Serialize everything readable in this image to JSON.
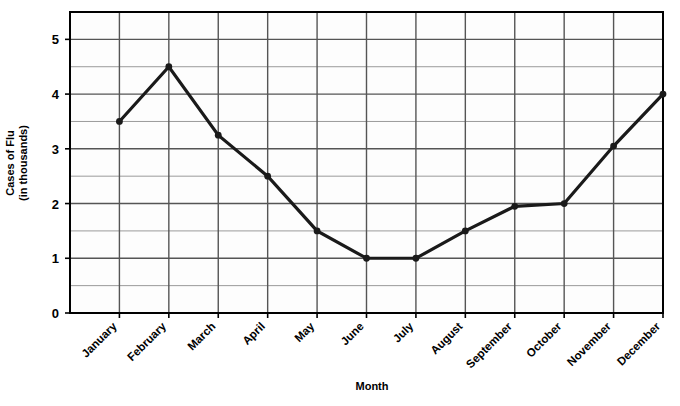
{
  "chart_data": {
    "type": "line",
    "title": "",
    "xlabel": "Month",
    "ylabel": "Cases of Flu (in thousands)",
    "ylabel_lines": [
      "Cases of Flu",
      "(in thousands)"
    ],
    "categories": [
      "January",
      "February",
      "March",
      "April",
      "May",
      "June",
      "July",
      "August",
      "September",
      "October",
      "November",
      "December"
    ],
    "values": [
      3.5,
      4.5,
      3.25,
      2.5,
      1.5,
      1.0,
      1.0,
      1.5,
      1.95,
      2.0,
      3.05,
      4.0
    ],
    "series": [
      {
        "name": "Cases of Flu",
        "values": [
          3.5,
          4.5,
          3.25,
          2.5,
          1.5,
          1.0,
          1.0,
          1.5,
          1.95,
          2.0,
          3.05,
          4.0
        ]
      }
    ],
    "ylim": [
      0,
      5.5
    ],
    "ytick_labels": [
      "0",
      "1",
      "2",
      "3",
      "4",
      "5"
    ],
    "ytick_values": [
      0,
      1,
      2,
      3,
      4,
      5
    ],
    "minor_gridline_step": 0.5,
    "grid": true,
    "legend": "none",
    "marker": "filled-circle",
    "line_color": "#1a1a1a",
    "grid_color_major": "#555555",
    "grid_color_minor": "#9a9a9a",
    "axis_color": "#000000",
    "plot_background": "#fdfdfd",
    "category_label_rotation_deg": -45
  }
}
